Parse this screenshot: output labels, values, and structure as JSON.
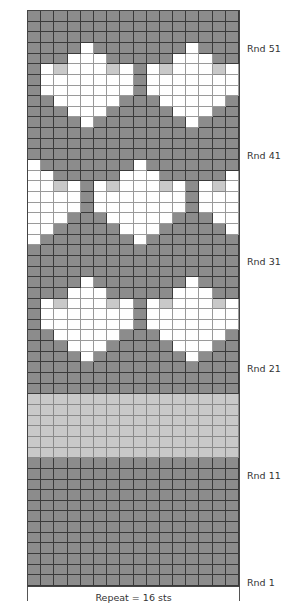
{
  "chart_data": {
    "type": "heatmap",
    "title": "",
    "subtitle": "Colorwork knitting chart",
    "columns": 16,
    "rows": 54,
    "row_order": "top-to-bottom, Rnd 54 to Rnd 1",
    "legend": {
      "D": {
        "name": "dark gray",
        "color": "#8c8c8c"
      },
      "W": {
        "name": "white",
        "color": "#ffffff"
      },
      "L": {
        "name": "light gray",
        "color": "#c9c9c9"
      }
    },
    "grid": [
      "DDDDDDDDDDDDDDDD",
      "DDDDDDDDDDDDDDDD",
      "DDDDDDDDDDDDDDDD",
      "DDDDWDDDDDDDWDDD",
      "DDDWWWDDDDDWWWDD",
      "DWLWWWLWDWLWWWLW",
      "DWWWWWWWDWWWWWWW",
      "DWWWWWWWDWWWWWWW",
      "DDWWWWWDDDWWWWWD",
      "DDDWWWDDDDDWWWDD",
      "DDDDWDDDDDDDWDDD",
      "DDDDDDDDDDDDDDDD",
      "DDDDDDDDDDDDDDDD",
      "DDDDDDDDDDDDDDDD",
      "WDDDDDDDWDDDDDDD",
      "WWDDDDDWWWDDDDDW",
      "WWLWDWLWWWLWDWLW",
      "WWWWDWWWWWWWDWWW",
      "WWWWDWWWWWWWDWWW",
      "WWWDDDWWWWWDDDWW",
      "WWDDDDDWWWDDDDDW",
      "WDDDDDDDWDDDDDDD",
      "DDDDDDDDDDDDDDDD",
      "DDDDDDDDDDDDDDDD",
      "DDDDDDDDDDDDDDDD",
      "DDDDWDDDDDDDWDDD",
      "DDDWWWDDDDDWWWDD",
      "DWLWWWLWDWLWWWLW",
      "DWWWWWWWDWWWWWWW",
      "DWWWWWWWDWWWWWWW",
      "DDWWWWWDDDWWWWWD",
      "DDDWWWDDDDDWWWDD",
      "DDDDWDDDDDDDWDDD",
      "DDDDDDDDDDDDDDDD",
      "DDDDDDDDDDDDDDDD",
      "DDDDDDDDDDDDDDDD",
      "LLLLLLLLLLLLLLLL",
      "LLLLLLLLLLLLLLLL",
      "LLLLLLLLLLLLLLLL",
      "LLLLLLLLLLLLLLLL",
      "LLLLLLLLLLLLLLLL",
      "LLLLLLLLLLLLLLLL",
      "DDDDDDDDDDDDDDDD",
      "DDDDDDDDDDDDDDDD",
      "DDDDDDDDDDDDDDDD",
      "DDDDDDDDDDDDDDDD",
      "DDDDDDDDDDDDDDDD",
      "DDDDDDDDDDDDDDDD",
      "DDDDDDDDDDDDDDDD",
      "DDDDDDDDDDDDDDDD",
      "DDDDDDDDDDDDDDDD",
      "DDDDDDDDDDDDDDDD",
      "DDDDDDDDDDDDDDDD",
      "DDDDDDDDDDDDDDDD"
    ],
    "row_labels": [
      {
        "label": "Rnd 51",
        "round": 51
      },
      {
        "label": "Rnd 41",
        "round": 41
      },
      {
        "label": "Rnd 31",
        "round": 31
      },
      {
        "label": "Rnd 21",
        "round": 21
      },
      {
        "label": "Rnd 11",
        "round": 11
      },
      {
        "label": "Rnd 1",
        "round": 1
      }
    ],
    "xlabel": "Repeat = 16 sts",
    "ylabel": ""
  },
  "labels": {
    "rnd51": "Rnd 51",
    "rnd41": "Rnd 41",
    "rnd31": "Rnd 31",
    "rnd21": "Rnd 21",
    "rnd11": "Rnd 11",
    "rnd1": "Rnd 1",
    "caption": "Repeat = 16 sts"
  }
}
